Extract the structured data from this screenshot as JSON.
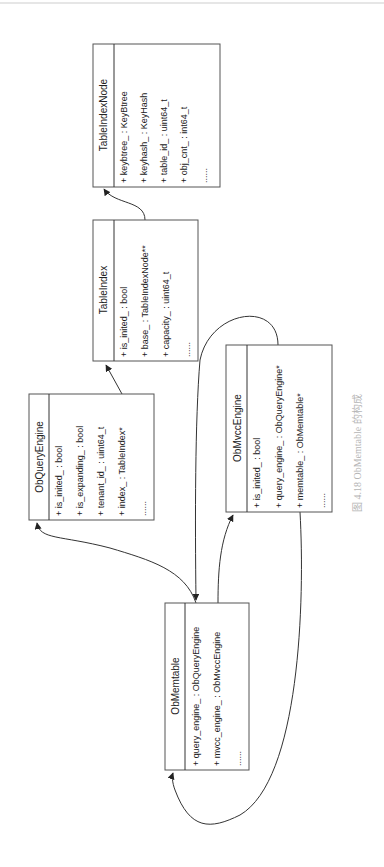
{
  "diagram": {
    "type": "uml-class-diagram",
    "orientation": "rotated-90-ccw",
    "classes": {
      "table_index_node": {
        "name": "TableIndexNode",
        "attributes": [
          "+ keybtree_ : KeyBtree",
          "+ keyhash_ : KeyHash",
          "+ table_id_ : uint64_t",
          "+ obj_cnt_ : int64_t",
          "......"
        ]
      },
      "table_index": {
        "name": "TableIndex",
        "attributes": [
          "+ is_inited_ : bool",
          "+ base_ : TableIndexNode**",
          "+ capacity_ : uint64_t",
          "......"
        ]
      },
      "ob_query_engine": {
        "name": "ObQueryEngine",
        "attributes": [
          "+ is_inited_ : bool",
          "+ is_expanding_ : bool",
          "+ tenant_id_ : uint64_t",
          "+ index_ : TableIndex*",
          "......"
        ]
      },
      "ob_mvcc_engine": {
        "name": "ObMvccEngine",
        "attributes": [
          "+ is_inited_ : bool",
          "+ query_engine_ : ObQueryEngine*",
          "+ memtable_ : ObMemtable*",
          "......"
        ]
      },
      "ob_memtable": {
        "name": "ObMemtable",
        "attributes": [
          "+ query_engine_ : ObQueryEngine",
          "+ mvcc_engine_ : ObMvccEngine",
          "......"
        ]
      }
    },
    "edges": [
      {
        "from": "TableIndex",
        "to": "TableIndexNode"
      },
      {
        "from": "ObQueryEngine",
        "to": "TableIndex"
      },
      {
        "from": "ObMemtable",
        "to": "ObQueryEngine"
      },
      {
        "from": "ObMemtable",
        "to": "ObMvccEngine"
      },
      {
        "from": "ObMvccEngine",
        "to": "ObMemtable"
      }
    ],
    "caption": "图 4.18   ObMemtable 的构成",
    "colors": {
      "line": "#333333",
      "box_border": "#555555",
      "caption": "#b5b5b5"
    }
  }
}
